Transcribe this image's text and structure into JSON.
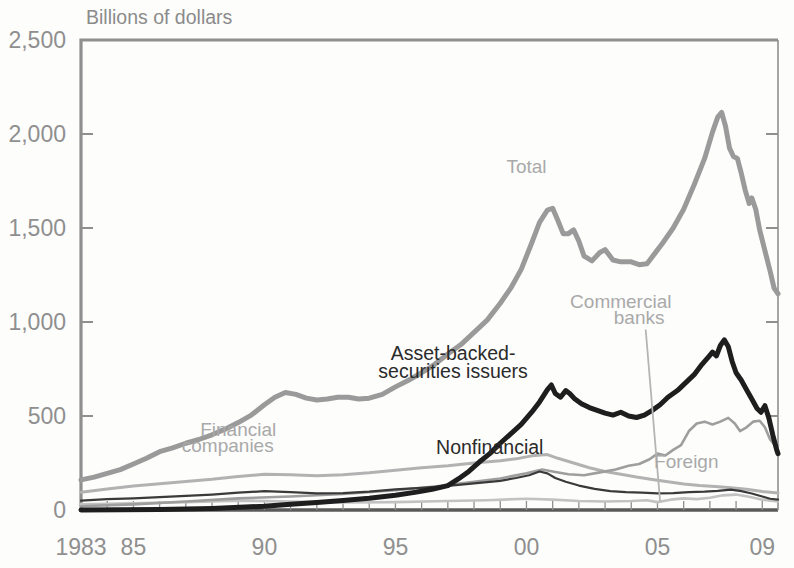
{
  "chart_data": {
    "type": "line",
    "title": "",
    "ylabel": "Billions of dollars",
    "xlabel": "",
    "ylim": [
      0,
      2500
    ],
    "xlim": [
      1983,
      2009.6
    ],
    "yticks": [
      0,
      500,
      1000,
      1500,
      2000,
      2500
    ],
    "ytick_labels": [
      "0",
      "500",
      "1,000",
      "1,500",
      "2,000",
      "2,500"
    ],
    "xticks": [
      1983,
      1985,
      1990,
      1995,
      2000,
      2005,
      2009
    ],
    "xtick_labels": [
      "1983",
      "85",
      "90",
      "95",
      "00",
      "05",
      "09"
    ],
    "grid": false,
    "legend": "inline-annotations",
    "colors": {
      "total": "#9a9a9a",
      "asset_backed": "#1e1e1e",
      "financial_companies": "#b4b4b4",
      "nonfinancial": "#707070",
      "foreign": "#b0b0b0",
      "commercial_banks": "#c4c4c4",
      "axis": "#8f8f8f",
      "text": "#8b8b8b"
    },
    "annotations": [
      {
        "text": "Total",
        "x": 2000.0,
        "y": 1790,
        "tone": "light"
      },
      {
        "text": "Asset-backed-",
        "x": 1997.2,
        "y": 800,
        "tone": "dark"
      },
      {
        "text": "securities issuers",
        "x": 1997.2,
        "y": 700,
        "tone": "dark"
      },
      {
        "text": "Commercial",
        "x": 2003.6,
        "y": 1075,
        "tone": "light"
      },
      {
        "text": "banks",
        "x": 2004.3,
        "y": 990,
        "tone": "light"
      },
      {
        "text": "Financial",
        "x": 1989.0,
        "y": 395,
        "tone": "light"
      },
      {
        "text": "companies",
        "x": 1988.6,
        "y": 310,
        "tone": "light"
      },
      {
        "text": "Nonfinancial",
        "x": 1998.6,
        "y": 300,
        "tone": "dark"
      },
      {
        "text": "Foreign",
        "x": 2006.1,
        "y": 225,
        "tone": "light"
      }
    ],
    "series": [
      {
        "name": "Total",
        "color": "#9a9a9a",
        "width": 5.0,
        "points": [
          [
            1983.0,
            160
          ],
          [
            1983.5,
            175
          ],
          [
            1984.0,
            195
          ],
          [
            1984.5,
            215
          ],
          [
            1985.0,
            245
          ],
          [
            1985.5,
            275
          ],
          [
            1986.0,
            310
          ],
          [
            1986.5,
            330
          ],
          [
            1987.0,
            355
          ],
          [
            1987.5,
            375
          ],
          [
            1988.0,
            400
          ],
          [
            1988.5,
            430
          ],
          [
            1989.0,
            465
          ],
          [
            1989.5,
            505
          ],
          [
            1990.0,
            560
          ],
          [
            1990.4,
            600
          ],
          [
            1990.8,
            625
          ],
          [
            1991.2,
            615
          ],
          [
            1991.6,
            595
          ],
          [
            1992.0,
            585
          ],
          [
            1992.4,
            590
          ],
          [
            1992.8,
            600
          ],
          [
            1993.2,
            600
          ],
          [
            1993.6,
            590
          ],
          [
            1994.0,
            595
          ],
          [
            1994.5,
            615
          ],
          [
            1995.0,
            655
          ],
          [
            1995.5,
            690
          ],
          [
            1996.0,
            730
          ],
          [
            1996.5,
            775
          ],
          [
            1997.0,
            830
          ],
          [
            1997.5,
            880
          ],
          [
            1998.0,
            945
          ],
          [
            1998.5,
            1010
          ],
          [
            1999.0,
            1100
          ],
          [
            1999.4,
            1180
          ],
          [
            1999.8,
            1280
          ],
          [
            2000.2,
            1420
          ],
          [
            2000.5,
            1530
          ],
          [
            2000.8,
            1595
          ],
          [
            2001.0,
            1605
          ],
          [
            2001.2,
            1540
          ],
          [
            2001.4,
            1470
          ],
          [
            2001.6,
            1470
          ],
          [
            2001.8,
            1490
          ],
          [
            2002.0,
            1430
          ],
          [
            2002.2,
            1350
          ],
          [
            2002.5,
            1325
          ],
          [
            2002.8,
            1370
          ],
          [
            2003.0,
            1385
          ],
          [
            2003.3,
            1330
          ],
          [
            2003.6,
            1320
          ],
          [
            2004.0,
            1320
          ],
          [
            2004.3,
            1305
          ],
          [
            2004.6,
            1310
          ],
          [
            2004.9,
            1365
          ],
          [
            2005.2,
            1420
          ],
          [
            2005.6,
            1500
          ],
          [
            2006.0,
            1600
          ],
          [
            2006.4,
            1730
          ],
          [
            2006.8,
            1870
          ],
          [
            2007.1,
            2010
          ],
          [
            2007.3,
            2090
          ],
          [
            2007.45,
            2115
          ],
          [
            2007.6,
            2040
          ],
          [
            2007.75,
            1925
          ],
          [
            2007.9,
            1880
          ],
          [
            2008.05,
            1870
          ],
          [
            2008.2,
            1790
          ],
          [
            2008.35,
            1700
          ],
          [
            2008.5,
            1630
          ],
          [
            2008.6,
            1660
          ],
          [
            2008.75,
            1600
          ],
          [
            2008.9,
            1490
          ],
          [
            2009.1,
            1380
          ],
          [
            2009.3,
            1270
          ],
          [
            2009.45,
            1180
          ],
          [
            2009.6,
            1150
          ]
        ]
      },
      {
        "name": "Asset-backed-securities issuers",
        "color": "#1e1e1e",
        "width": 5.0,
        "points": [
          [
            1983.0,
            0
          ],
          [
            1986.0,
            2
          ],
          [
            1988.0,
            8
          ],
          [
            1990.0,
            20
          ],
          [
            1991.0,
            30
          ],
          [
            1992.0,
            40
          ],
          [
            1993.0,
            50
          ],
          [
            1994.0,
            62
          ],
          [
            1995.0,
            78
          ],
          [
            1995.8,
            95
          ],
          [
            1996.4,
            110
          ],
          [
            1997.0,
            130
          ],
          [
            1997.4,
            165
          ],
          [
            1997.8,
            205
          ],
          [
            1998.2,
            255
          ],
          [
            1998.6,
            300
          ],
          [
            1999.0,
            355
          ],
          [
            1999.4,
            405
          ],
          [
            1999.8,
            455
          ],
          [
            2000.2,
            520
          ],
          [
            2000.5,
            575
          ],
          [
            2000.8,
            640
          ],
          [
            2000.95,
            665
          ],
          [
            2001.1,
            620
          ],
          [
            2001.3,
            600
          ],
          [
            2001.5,
            635
          ],
          [
            2001.65,
            620
          ],
          [
            2001.85,
            590
          ],
          [
            2002.1,
            565
          ],
          [
            2002.4,
            545
          ],
          [
            2002.7,
            530
          ],
          [
            2003.0,
            515
          ],
          [
            2003.3,
            505
          ],
          [
            2003.6,
            520
          ],
          [
            2003.9,
            500
          ],
          [
            2004.2,
            492
          ],
          [
            2004.5,
            505
          ],
          [
            2004.8,
            530
          ],
          [
            2005.1,
            560
          ],
          [
            2005.4,
            600
          ],
          [
            2005.8,
            640
          ],
          [
            2006.1,
            680
          ],
          [
            2006.4,
            720
          ],
          [
            2006.7,
            775
          ],
          [
            2006.95,
            815
          ],
          [
            2007.1,
            840
          ],
          [
            2007.25,
            820
          ],
          [
            2007.4,
            875
          ],
          [
            2007.55,
            905
          ],
          [
            2007.7,
            870
          ],
          [
            2007.85,
            790
          ],
          [
            2008.0,
            730
          ],
          [
            2008.2,
            690
          ],
          [
            2008.4,
            640
          ],
          [
            2008.6,
            590
          ],
          [
            2008.8,
            540
          ],
          [
            2008.95,
            520
          ],
          [
            2009.1,
            555
          ],
          [
            2009.25,
            490
          ],
          [
            2009.4,
            400
          ],
          [
            2009.55,
            320
          ],
          [
            2009.6,
            300
          ]
        ]
      },
      {
        "name": "Foreign",
        "color": "#9e9e9e",
        "width": 2.6,
        "points": [
          [
            1983.0,
            20
          ],
          [
            1985.0,
            30
          ],
          [
            1987.0,
            45
          ],
          [
            1989.0,
            62
          ],
          [
            1991.0,
            72
          ],
          [
            1993.0,
            85
          ],
          [
            1995.0,
            105
          ],
          [
            1996.5,
            125
          ],
          [
            1998.0,
            150
          ],
          [
            1999.0,
            168
          ],
          [
            2000.0,
            195
          ],
          [
            2000.6,
            215
          ],
          [
            2001.0,
            205
          ],
          [
            2001.6,
            190
          ],
          [
            2002.2,
            185
          ],
          [
            2002.8,
            200
          ],
          [
            2003.4,
            215
          ],
          [
            2003.9,
            235
          ],
          [
            2004.3,
            245
          ],
          [
            2004.7,
            270
          ],
          [
            2005.0,
            300
          ],
          [
            2005.3,
            290
          ],
          [
            2005.6,
            320
          ],
          [
            2005.9,
            345
          ],
          [
            2006.2,
            420
          ],
          [
            2006.5,
            460
          ],
          [
            2006.8,
            470
          ],
          [
            2007.1,
            455
          ],
          [
            2007.4,
            470
          ],
          [
            2007.7,
            490
          ],
          [
            2007.95,
            460
          ],
          [
            2008.15,
            420
          ],
          [
            2008.4,
            440
          ],
          [
            2008.65,
            470
          ],
          [
            2008.9,
            475
          ],
          [
            2009.1,
            440
          ],
          [
            2009.3,
            375
          ],
          [
            2009.45,
            350
          ],
          [
            2009.6,
            345
          ]
        ]
      },
      {
        "name": "Financial companies",
        "color": "#b2b2b2",
        "width": 3.0,
        "points": [
          [
            1983.0,
            95
          ],
          [
            1984.0,
            112
          ],
          [
            1985.0,
            128
          ],
          [
            1986.0,
            140
          ],
          [
            1987.0,
            152
          ],
          [
            1988.0,
            163
          ],
          [
            1989.0,
            178
          ],
          [
            1990.0,
            190
          ],
          [
            1991.0,
            188
          ],
          [
            1992.0,
            182
          ],
          [
            1993.0,
            188
          ],
          [
            1994.0,
            198
          ],
          [
            1995.0,
            212
          ],
          [
            1996.0,
            225
          ],
          [
            1997.0,
            235
          ],
          [
            1998.0,
            250
          ],
          [
            1999.0,
            262
          ],
          [
            1999.6,
            272
          ],
          [
            2000.2,
            288
          ],
          [
            2000.8,
            295
          ],
          [
            2001.2,
            275
          ],
          [
            2001.8,
            250
          ],
          [
            2002.4,
            225
          ],
          [
            2003.0,
            205
          ],
          [
            2003.6,
            190
          ],
          [
            2004.2,
            175
          ],
          [
            2004.8,
            162
          ],
          [
            2005.4,
            150
          ],
          [
            2006.0,
            138
          ],
          [
            2006.6,
            130
          ],
          [
            2007.2,
            125
          ],
          [
            2007.8,
            118
          ],
          [
            2008.4,
            110
          ],
          [
            2009.0,
            98
          ],
          [
            2009.6,
            90
          ]
        ]
      },
      {
        "name": "Nonfinancial",
        "color": "#3a3a3a",
        "width": 2.2,
        "points": [
          [
            1983.0,
            50
          ],
          [
            1984.0,
            58
          ],
          [
            1985.0,
            62
          ],
          [
            1986.0,
            68
          ],
          [
            1987.0,
            75
          ],
          [
            1988.0,
            82
          ],
          [
            1989.0,
            92
          ],
          [
            1990.0,
            100
          ],
          [
            1991.0,
            95
          ],
          [
            1992.0,
            88
          ],
          [
            1993.0,
            90
          ],
          [
            1994.0,
            98
          ],
          [
            1995.0,
            110
          ],
          [
            1996.0,
            118
          ],
          [
            1997.0,
            128
          ],
          [
            1998.0,
            142
          ],
          [
            1999.0,
            155
          ],
          [
            1999.6,
            170
          ],
          [
            2000.1,
            185
          ],
          [
            2000.5,
            205
          ],
          [
            2000.8,
            195
          ],
          [
            2001.1,
            170
          ],
          [
            2001.5,
            150
          ],
          [
            2002.0,
            130
          ],
          [
            2002.6,
            112
          ],
          [
            2003.2,
            100
          ],
          [
            2003.8,
            95
          ],
          [
            2004.4,
            92
          ],
          [
            2005.0,
            88
          ],
          [
            2005.6,
            90
          ],
          [
            2006.2,
            95
          ],
          [
            2006.8,
            98
          ],
          [
            2007.3,
            102
          ],
          [
            2007.8,
            108
          ],
          [
            2008.2,
            100
          ],
          [
            2008.6,
            88
          ],
          [
            2009.0,
            72
          ],
          [
            2009.3,
            60
          ],
          [
            2009.6,
            55
          ]
        ]
      },
      {
        "name": "Commercial banks",
        "color": "#c2c2c2",
        "width": 2.6,
        "points": [
          [
            1983.0,
            30
          ],
          [
            1985.0,
            35
          ],
          [
            1987.0,
            42
          ],
          [
            1989.0,
            50
          ],
          [
            1991.0,
            45
          ],
          [
            1993.0,
            40
          ],
          [
            1995.0,
            42
          ],
          [
            1997.0,
            48
          ],
          [
            1998.5,
            52
          ],
          [
            2000.0,
            60
          ],
          [
            2001.0,
            55
          ],
          [
            2002.0,
            48
          ],
          [
            2003.0,
            45
          ],
          [
            2004.0,
            48
          ],
          [
            2004.6,
            52
          ],
          [
            2005.0,
            42
          ],
          [
            2005.5,
            55
          ],
          [
            2006.0,
            62
          ],
          [
            2006.5,
            58
          ],
          [
            2007.0,
            65
          ],
          [
            2007.5,
            78
          ],
          [
            2008.0,
            82
          ],
          [
            2008.5,
            70
          ],
          [
            2009.0,
            55
          ],
          [
            2009.6,
            45
          ]
        ]
      }
    ],
    "leader_lines": [
      {
        "name": "commercial-banks-leader",
        "x1": 2004.55,
        "y1": 960,
        "x2": 2005.1,
        "y2": 45
      }
    ]
  }
}
